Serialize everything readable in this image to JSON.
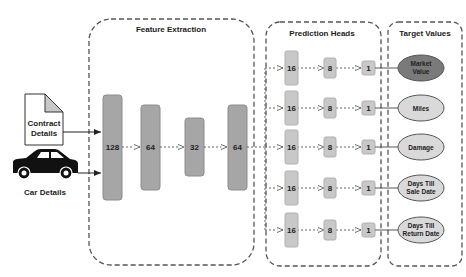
{
  "groups": {
    "feature_extraction": {
      "title": "Feature Extraction"
    },
    "prediction_heads": {
      "title": "Prediction Heads"
    },
    "target_values": {
      "title": "Target Values"
    }
  },
  "inputs": [
    {
      "label_line1": "Contract",
      "label_line2": "Details",
      "icon": "document-icon"
    },
    {
      "label": "Car Details",
      "icon": "car-icon"
    }
  ],
  "feature_layers": [
    "128",
    "64",
    "32",
    "64"
  ],
  "heads": [
    {
      "layers": [
        "16",
        "8",
        "1"
      ],
      "target_line1": "Market",
      "target_line2": "Value",
      "highlight": true
    },
    {
      "layers": [
        "16",
        "8",
        "1"
      ],
      "target_line1": "Miles",
      "target_line2": ""
    },
    {
      "layers": [
        "16",
        "8",
        "1"
      ],
      "target_line1": "Damage",
      "target_line2": ""
    },
    {
      "layers": [
        "16",
        "8",
        "1"
      ],
      "target_line1": "Days Till",
      "target_line2": "Sale Date"
    },
    {
      "layers": [
        "16",
        "8",
        "1"
      ],
      "target_line1": "Days Till",
      "target_line2": "Return Date"
    }
  ],
  "colors": {
    "layer_fill": "#a6a6a6",
    "layer_stroke": "#8c8c8c",
    "head_fill": "#c8c8c8",
    "target_fill": "#d9d9d9",
    "target_highlight_fill": "#7a7a7a",
    "dash": "#555555"
  }
}
